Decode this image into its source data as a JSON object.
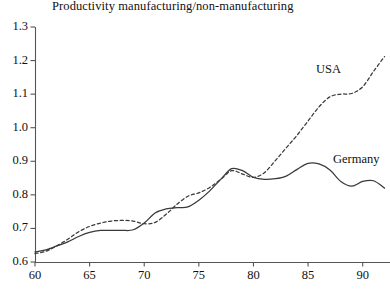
{
  "chart_data": {
    "type": "line",
    "title": "Productivity manufacturing/non-manufacturing",
    "xlabel": "",
    "ylabel": "",
    "xlim": [
      60,
      92.5
    ],
    "ylim": [
      0.6,
      1.3
    ],
    "xticks": [
      60,
      65,
      70,
      75,
      80,
      85,
      90
    ],
    "xtick_labels": [
      "60",
      "65",
      "70",
      "75",
      "80",
      "85",
      "90"
    ],
    "yticks": [
      0.6,
      0.7,
      0.8,
      0.9,
      1.0,
      1.1,
      1.2,
      1.3
    ],
    "ytick_labels": [
      "0.6",
      "0.7",
      "0.8",
      "0.9",
      "1.0",
      "1.1",
      "1.2",
      "1.3"
    ],
    "grid": false,
    "legend_position": "inline-annotations",
    "x": [
      60,
      61,
      62,
      63,
      64,
      65,
      66,
      67,
      68,
      69,
      70,
      71,
      72,
      73,
      74,
      75,
      76,
      77,
      78,
      79,
      80,
      81,
      82,
      83,
      84,
      85,
      86,
      87,
      88,
      89,
      90,
      91,
      92
    ],
    "series": [
      {
        "name": "USA",
        "style": "dashed",
        "color": "#3a3a3a",
        "values": [
          0.625,
          0.632,
          0.648,
          0.668,
          0.69,
          0.706,
          0.716,
          0.722,
          0.724,
          0.722,
          0.714,
          0.718,
          0.742,
          0.772,
          0.796,
          0.806,
          0.822,
          0.846,
          0.872,
          0.862,
          0.852,
          0.866,
          0.902,
          0.94,
          0.978,
          1.02,
          1.062,
          1.092,
          1.1,
          1.102,
          1.122,
          1.168,
          1.212
        ]
      },
      {
        "name": "Germany",
        "style": "solid",
        "color": "#3a3a3a",
        "values": [
          0.63,
          0.636,
          0.648,
          0.66,
          0.676,
          0.688,
          0.694,
          0.694,
          0.694,
          0.696,
          0.716,
          0.746,
          0.758,
          0.762,
          0.764,
          0.784,
          0.812,
          0.846,
          0.878,
          0.872,
          0.852,
          0.846,
          0.848,
          0.856,
          0.876,
          0.894,
          0.892,
          0.874,
          0.84,
          0.826,
          0.84,
          0.842,
          0.82
        ]
      }
    ],
    "annotations": [
      {
        "text": "USA",
        "x": 89.0,
        "y": 1.135
      },
      {
        "text": "Germany",
        "x": 90.6,
        "y": 0.865
      }
    ]
  },
  "axis": {
    "origin_x_px": 35,
    "origin_y_px": 262,
    "top_y_px": 27,
    "right_x_px": 390
  }
}
